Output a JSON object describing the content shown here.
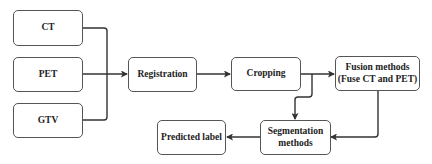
{
  "diagram": {
    "nodes": {
      "ct": {
        "label": "CT"
      },
      "pet": {
        "label": "PET"
      },
      "gtv": {
        "label": "GTV"
      },
      "registration": {
        "label": "Registration"
      },
      "cropping": {
        "label": "Cropping"
      },
      "fusion": {
        "line1": "Fusion methods",
        "line2": "(Fuse CT and PET)"
      },
      "segmentation": {
        "line1": "Segmentation",
        "line2": "methods"
      },
      "predicted": {
        "label": "Predicted label"
      }
    },
    "edges": [
      {
        "from": "CT",
        "to": "Registration"
      },
      {
        "from": "PET",
        "to": "Registration"
      },
      {
        "from": "GTV",
        "to": "Registration"
      },
      {
        "from": "Registration",
        "to": "Cropping"
      },
      {
        "from": "Cropping",
        "to": "Fusion methods (Fuse CT and PET)"
      },
      {
        "from": "Cropping",
        "to": "Segmentation methods"
      },
      {
        "from": "Fusion methods (Fuse CT and PET)",
        "to": "Segmentation methods"
      },
      {
        "from": "Segmentation methods",
        "to": "Predicted label"
      }
    ]
  }
}
